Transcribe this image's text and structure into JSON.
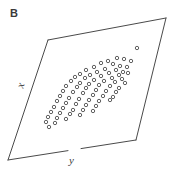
{
  "figure": {
    "panel_letter": "B",
    "axis_labels": {
      "x": "x",
      "y": "y"
    },
    "colors": {
      "frame_stroke": "#4a4a4a",
      "point_stroke": "#4f4f4f",
      "background": "#ffffff",
      "text": "#3a3a3a"
    },
    "frame": {
      "type": "parallelogram",
      "stroke_width": 1,
      "vertices": [
        {
          "name": "top-left",
          "x": 48,
          "y": 40
        },
        {
          "name": "top-right",
          "x": 166,
          "y": 18
        },
        {
          "name": "bottom-right",
          "x": 136,
          "y": 140
        },
        {
          "name": "bottom-left",
          "x": 8,
          "y": 160
        }
      ],
      "bottom_edge_gap": {
        "from_x": 68,
        "to_x": 81
      }
    }
  },
  "chart_data": {
    "type": "scatter",
    "title": "B",
    "xlabel": "x",
    "ylabel": "y",
    "grid": false,
    "legend": null,
    "marker": {
      "shape": "open-circle",
      "radius": 1.7,
      "stroke": "#4f4f4f",
      "stroke_width": 0.9,
      "fill": "none"
    },
    "n_points": 72,
    "xlim": [
      0,
      171
    ],
    "ylim": [
      0,
      174
    ],
    "points": [
      [
        137,
        48
      ],
      [
        117,
        58
      ],
      [
        124,
        59
      ],
      [
        131,
        61
      ],
      [
        108,
        61
      ],
      [
        101,
        63
      ],
      [
        113,
        64
      ],
      [
        120,
        66
      ],
      [
        127,
        67
      ],
      [
        94,
        67
      ],
      [
        105,
        69
      ],
      [
        116,
        70
      ],
      [
        123,
        72
      ],
      [
        86,
        70
      ],
      [
        97,
        72
      ],
      [
        109,
        73
      ],
      [
        119,
        75
      ],
      [
        128,
        73
      ],
      [
        80,
        74
      ],
      [
        90,
        75
      ],
      [
        101,
        76
      ],
      [
        112,
        78
      ],
      [
        122,
        79
      ],
      [
        75,
        77
      ],
      [
        85,
        78
      ],
      [
        94,
        80
      ],
      [
        104,
        81
      ],
      [
        115,
        82
      ],
      [
        125,
        83
      ],
      [
        71,
        81
      ],
      [
        80,
        83
      ],
      [
        89,
        84
      ],
      [
        99,
        85
      ],
      [
        110,
        86
      ],
      [
        119,
        88
      ],
      [
        66,
        86
      ],
      [
        77,
        87
      ],
      [
        86,
        88
      ],
      [
        96,
        90
      ],
      [
        106,
        91
      ],
      [
        116,
        92
      ],
      [
        63,
        91
      ],
      [
        73,
        92
      ],
      [
        83,
        93
      ],
      [
        93,
        95
      ],
      [
        103,
        96
      ],
      [
        113,
        97
      ],
      [
        60,
        96
      ],
      [
        69,
        98
      ],
      [
        79,
        99
      ],
      [
        89,
        100
      ],
      [
        99,
        101
      ],
      [
        110,
        100
      ],
      [
        57,
        101
      ],
      [
        66,
        103
      ],
      [
        76,
        104
      ],
      [
        86,
        105
      ],
      [
        96,
        106
      ],
      [
        54,
        107
      ],
      [
        63,
        108
      ],
      [
        73,
        110
      ],
      [
        83,
        110
      ],
      [
        93,
        111
      ],
      [
        51,
        112
      ],
      [
        60,
        113
      ],
      [
        70,
        114
      ],
      [
        80,
        115
      ],
      [
        48,
        117
      ],
      [
        57,
        118
      ],
      [
        66,
        119
      ],
      [
        46,
        122
      ],
      [
        55,
        123
      ],
      [
        49,
        127
      ]
    ]
  }
}
